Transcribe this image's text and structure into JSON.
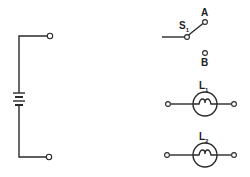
{
  "diagram": {
    "type": "electrical-schematic",
    "colors": {
      "line": "#2a2a2a",
      "background": "#ffffff"
    },
    "components": {
      "battery": {
        "label": ""
      },
      "switch": {
        "label": "S",
        "subscript": "1",
        "position_a": "A",
        "position_b": "B"
      },
      "lamp1": {
        "label": "L",
        "subscript": "1"
      },
      "lamp2": {
        "label": "L",
        "subscript": "2"
      }
    }
  }
}
